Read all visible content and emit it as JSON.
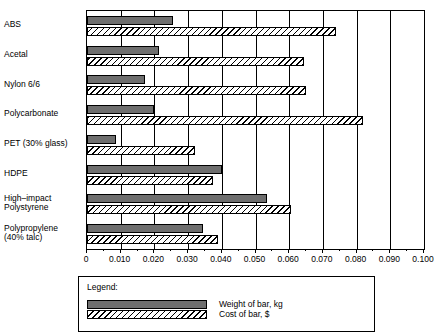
{
  "chart_data": {
    "type": "bar",
    "orientation": "horizontal",
    "title": "",
    "xlabel": "",
    "ylabel": "",
    "xlim": [
      0,
      0.1
    ],
    "grid": true,
    "legend_position": "bottom",
    "legend_title": "Legend:",
    "categories": [
      "ABS",
      "Acetal",
      "Nylon 6/6",
      "Polycarbonate",
      "PET (30% glass)",
      "HDPE",
      "High–impact\nPolystyrene",
      "Polypropylene\n(40% talc)"
    ],
    "xticks": [
      0,
      0.01,
      0.02,
      0.03,
      0.04,
      0.05,
      0.06,
      0.07,
      0.08,
      0.09,
      0.1
    ],
    "xticklabels": [
      "0",
      "0.010",
      "0.020",
      "0.030",
      "0.040",
      "0.050",
      "0.060",
      "0.070",
      "0.080",
      "0.090",
      "0.100"
    ],
    "series": [
      {
        "name": "Weight of bar, kg",
        "fill": "solid-gray",
        "color": "#6e6e6e",
        "values": [
          0.0255,
          0.0215,
          0.0172,
          0.02,
          0.0085,
          0.04,
          0.0535,
          0.0345
        ]
      },
      {
        "name": "Cost of bar, $",
        "fill": "diagonal-hatch",
        "color": "#ffffff",
        "values": [
          0.074,
          0.0645,
          0.065,
          0.082,
          0.032,
          0.0375,
          0.0605,
          0.039
        ]
      }
    ]
  },
  "legend": {
    "title": "Legend:",
    "entries": [
      {
        "label": "Weight of bar, kg",
        "swatch": "solid-gray"
      },
      {
        "label": "Cost of bar, $",
        "swatch": "diagonal-hatch"
      }
    ]
  }
}
